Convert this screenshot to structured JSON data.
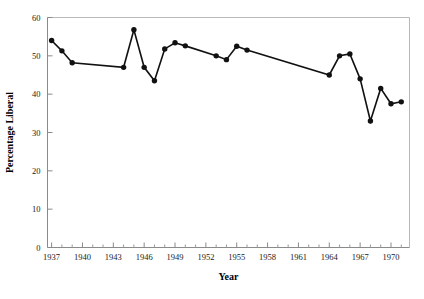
{
  "chart_data": {
    "type": "line",
    "title": "",
    "xlabel": "Year",
    "ylabel": "Percentage Liberal",
    "xlim": [
      1936.6,
      1971.8
    ],
    "ylim": [
      0,
      60
    ],
    "grid": false,
    "legend": null,
    "x_ticks": [
      1937,
      1940,
      1943,
      1946,
      1949,
      1952,
      1955,
      1958,
      1961,
      1964,
      1967,
      1970
    ],
    "x_tick_labels": [
      "1937",
      "1940",
      "1943",
      "1946",
      "1949",
      "1952",
      "1955",
      "1958",
      "1961",
      "1964",
      "1967",
      "1970"
    ],
    "x_minor_tick_step": 1,
    "y_ticks": [
      0,
      10,
      20,
      30,
      40,
      50,
      60
    ],
    "y_tick_labels": [
      "0",
      "10",
      "20",
      "30",
      "40",
      "50",
      "60"
    ],
    "marker": "filled-circle",
    "marker_color": "#111111",
    "line_color": "#111111",
    "series": [
      {
        "name": "Percentage Liberal",
        "x": [
          1937,
          1938,
          1939,
          1944,
          1945,
          1946,
          1947,
          1948,
          1949,
          1950,
          1953,
          1954,
          1955,
          1956,
          1964,
          1965,
          1966,
          1967,
          1968,
          1969,
          1970,
          1971
        ],
        "values": [
          54.0,
          51.3,
          48.2,
          47.0,
          56.8,
          47.0,
          43.5,
          51.8,
          53.4,
          52.6,
          50.0,
          49.0,
          52.5,
          51.5,
          45.0,
          50.0,
          50.5,
          44.0,
          33.0,
          41.5,
          37.5,
          38.0
        ]
      }
    ]
  },
  "axis": {
    "x_title": "Year",
    "y_title": "Percentage Liberal"
  }
}
